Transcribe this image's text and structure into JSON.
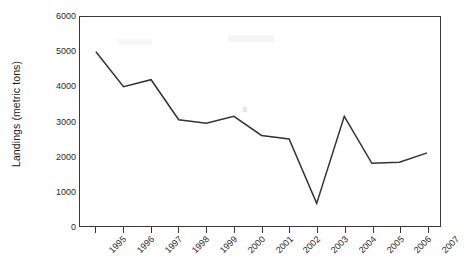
{
  "chart_data": {
    "type": "line",
    "title": "",
    "xlabel": "",
    "ylabel": "Landings (metric tons)",
    "categories": [
      "1995",
      "1996",
      "1997",
      "1998",
      "1999",
      "2000",
      "2001",
      "2002",
      "2003",
      "2004",
      "2005",
      "2006",
      "2007"
    ],
    "values": [
      5000,
      4000,
      4200,
      3050,
      2950,
      3150,
      2600,
      2500,
      650,
      3150,
      1800,
      1830,
      2100
    ],
    "series": [
      {
        "name": "Landings",
        "values": [
          5000,
          4000,
          4200,
          3050,
          2950,
          3150,
          2600,
          2500,
          650,
          3150,
          1800,
          1830,
          2100
        ]
      }
    ],
    "ylim": [
      0,
      6000
    ],
    "ytick_values": [
      6000,
      5000,
      4000,
      3000,
      2000,
      1000,
      0
    ],
    "ytick_labels": [
      "6000",
      "5000",
      "4000",
      "3000",
      "2000",
      "1000",
      "0"
    ],
    "xtick_labels": [
      "1995",
      "1996",
      "1997",
      "1998",
      "1999",
      "2000",
      "2001",
      "2002",
      "2003",
      "2004",
      "2005",
      "2006",
      "2007"
    ],
    "grid": false,
    "legend": "none",
    "line_color": "#333333",
    "background_color": "#ffffff",
    "axis_color": "#3a3a3a"
  }
}
